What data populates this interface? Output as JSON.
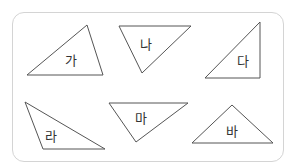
{
  "colors": {
    "stroke": "#555555",
    "frame": "#d4d4d4",
    "text": "#333333"
  },
  "triangles": [
    {
      "label": "가",
      "points": "27,75 87,25 103,75",
      "label_pos": [
        71,
        59
      ]
    },
    {
      "label": "나",
      "points": "119,26 191,26 142,73",
      "label_pos": [
        146,
        43
      ]
    },
    {
      "label": "다",
      "points": "205,78 260,22 260,78",
      "label_pos": [
        243,
        60
      ]
    },
    {
      "label": "라",
      "points": "25,102 105,149 43,149",
      "label_pos": [
        51,
        135
      ]
    },
    {
      "label": "마",
      "points": "109,103 188,103 136,142",
      "label_pos": [
        141,
        117
      ]
    },
    {
      "label": "바",
      "points": "192,143 232,105 273,143",
      "label_pos": [
        232,
        130
      ]
    }
  ]
}
